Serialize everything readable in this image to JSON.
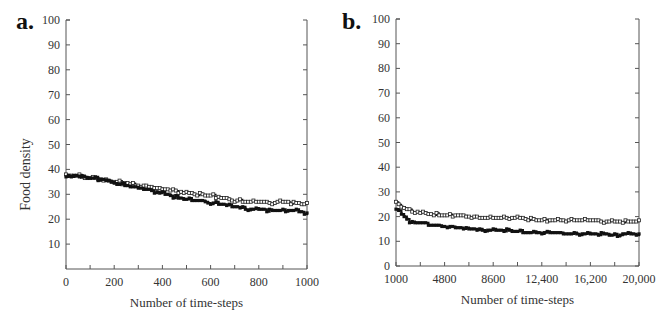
{
  "chart_data": [
    {
      "panel": "a.",
      "type": "line",
      "title": "",
      "xlabel": "Number of time-steps",
      "ylabel": "Food density",
      "xlim": [
        0,
        1000
      ],
      "ylim": [
        0,
        100
      ],
      "xticks": [
        0,
        200,
        400,
        600,
        800,
        1000
      ],
      "xminor_step": 100,
      "yticks": [
        10,
        20,
        30,
        40,
        50,
        60,
        70,
        80,
        90,
        100
      ],
      "x_tick_labels": [
        "0",
        "200",
        "400",
        "600",
        "800",
        "1000"
      ],
      "grid": false,
      "series": [
        {
          "name": "open-marker series",
          "marker": "open",
          "x": [
            0,
            50,
            100,
            150,
            200,
            250,
            300,
            350,
            400,
            450,
            500,
            550,
            600,
            650,
            700,
            750,
            800,
            850,
            900,
            950,
            1000
          ],
          "values": [
            37.5,
            37.5,
            36.5,
            36,
            35,
            34.5,
            33.5,
            33,
            32,
            31.5,
            30.5,
            30,
            29.5,
            28.5,
            27.5,
            27,
            27,
            26.5,
            27,
            26.5,
            26
          ]
        },
        {
          "name": "filled-marker series",
          "marker": "filled",
          "x": [
            0,
            50,
            100,
            150,
            200,
            250,
            300,
            350,
            400,
            450,
            500,
            550,
            600,
            650,
            700,
            750,
            800,
            850,
            900,
            950,
            1000
          ],
          "values": [
            37,
            37.5,
            36.5,
            36,
            34.5,
            33.5,
            32.5,
            31.5,
            30.5,
            29,
            28,
            27.5,
            26.5,
            26,
            25,
            24,
            24,
            23.5,
            23.5,
            23.5,
            22.5
          ]
        }
      ]
    },
    {
      "panel": "b.",
      "type": "line",
      "title": "",
      "xlabel": "Number of time-steps",
      "ylabel": "",
      "xlim": [
        1000,
        20000
      ],
      "ylim": [
        0,
        100
      ],
      "xticks": [
        1000,
        4800,
        8600,
        12400,
        16200,
        20000
      ],
      "xminor_step": 1900,
      "yticks": [
        0,
        10,
        20,
        30,
        40,
        50,
        60,
        70,
        80,
        90,
        100
      ],
      "x_tick_labels": [
        "1000",
        "4800",
        "8600",
        "12,400",
        "16,200",
        "20,000"
      ],
      "grid": false,
      "series": [
        {
          "name": "open-marker series",
          "marker": "open",
          "x": [
            1000,
            1500,
            2000,
            2500,
            3000,
            3800,
            4800,
            5800,
            6700,
            7600,
            8600,
            9500,
            10500,
            11500,
            12400,
            13400,
            14300,
            15300,
            16200,
            17200,
            18100,
            19100,
            20000
          ],
          "values": [
            25.5,
            24,
            22.5,
            22,
            21.5,
            21,
            20.5,
            20.5,
            20,
            19.5,
            19.5,
            19.5,
            19.5,
            19,
            18.5,
            18.5,
            18.5,
            18.5,
            18.5,
            18,
            18,
            18,
            18
          ]
        },
        {
          "name": "filled-marker series",
          "marker": "filled",
          "x": [
            1000,
            1500,
            2000,
            2500,
            3000,
            3800,
            4800,
            5800,
            6700,
            7600,
            8600,
            9500,
            10500,
            11500,
            12400,
            13400,
            14300,
            15300,
            16200,
            17200,
            18100,
            19100,
            20000
          ],
          "values": [
            23,
            20.5,
            18,
            17.5,
            17.5,
            16.5,
            16,
            15.5,
            15,
            14.5,
            14.5,
            14.5,
            14,
            13.5,
            13.5,
            13.5,
            13,
            13,
            13,
            13,
            12.5,
            13,
            13
          ]
        }
      ]
    }
  ]
}
